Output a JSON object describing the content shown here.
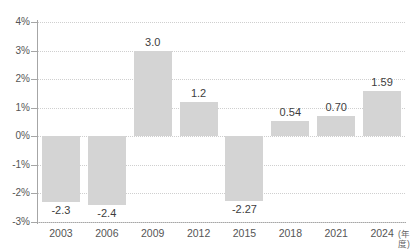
{
  "chart_data": {
    "type": "bar",
    "title": "",
    "subtitle": "",
    "xlabel": "(年度)",
    "ylabel": "",
    "categories": [
      "2003",
      "2006",
      "2009",
      "2012",
      "2015",
      "2018",
      "2021",
      "2024"
    ],
    "values": [
      -2.3,
      -2.4,
      3.0,
      1.2,
      -2.27,
      0.54,
      0.7,
      1.59
    ],
    "data_labels": [
      "-2.3",
      "-2.4",
      "3.0",
      "1.2",
      "-2.27",
      "0.54",
      "0.70",
      "1.59"
    ],
    "ylim": [
      -3,
      4
    ],
    "y_ticks": [
      4,
      3,
      2,
      1,
      0,
      -1,
      -2,
      -3
    ],
    "y_tick_labels": [
      "4%",
      "3%",
      "2%",
      "1%",
      "0%",
      "-1%",
      "-2%",
      "-3%"
    ],
    "grid": true,
    "grid_style": "dotted-horizontal",
    "legend": "none",
    "series": [
      {
        "name": "",
        "values": [
          -2.3,
          -2.4,
          3.0,
          1.2,
          -2.27,
          0.54,
          0.7,
          1.59
        ]
      }
    ]
  },
  "colors": {
    "bar_fill": "#d4d4d4",
    "axis_line": "#a6a6a6",
    "gridline": "#cfcfcf",
    "label_text": "#3d3d3d",
    "tick_text": "#555555",
    "background": "#ffffff"
  },
  "clipped_text": {
    "top": "",
    "bottom": ""
  }
}
